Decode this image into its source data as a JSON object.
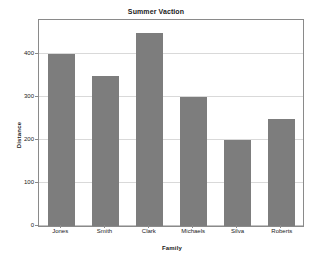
{
  "chart_data": {
    "type": "bar",
    "title": "Summer Vaction",
    "xlabel": "Family",
    "ylabel": "Distance",
    "categories": [
      "Jones",
      "Smith",
      "Clark",
      "Michaels",
      "Silva",
      "Roberts"
    ],
    "values": [
      400,
      350,
      450,
      300,
      200,
      250
    ],
    "yticks": [
      0,
      100,
      200,
      300,
      400
    ],
    "ytick_labels": [
      "0",
      "100",
      "200",
      "300",
      "400"
    ],
    "ylim": [
      0,
      480
    ],
    "grid": "horizontal",
    "legend": "none",
    "bar_color": "#7d7d7d",
    "gridline_color": "#d9d9d9",
    "frame_color": "#8a8a8a",
    "background_color": "#ffffff"
  }
}
